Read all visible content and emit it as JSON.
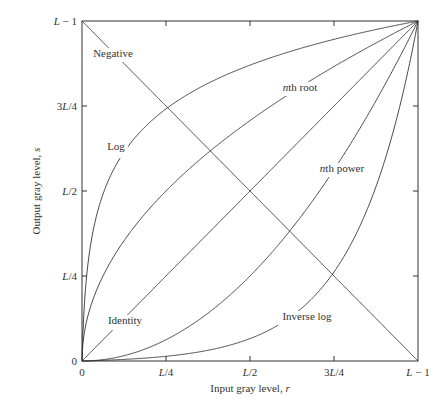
{
  "chart_data": {
    "type": "line",
    "title": "",
    "xlabel": "Input gray level, r",
    "ylabel": "Output gray level, s",
    "x_italic_var": "r",
    "y_italic_var": "s",
    "xlim": [
      0,
      1
    ],
    "ylim": [
      0,
      1
    ],
    "x_ticks": [
      {
        "value": 0,
        "label": "0"
      },
      {
        "value": 0.25,
        "label": "L/4"
      },
      {
        "value": 0.5,
        "label": "L/2"
      },
      {
        "value": 0.75,
        "label": "3L/4"
      },
      {
        "value": 1,
        "label": "L − 1"
      }
    ],
    "y_ticks": [
      {
        "value": 0,
        "label": "0"
      },
      {
        "value": 0.25,
        "label": "L/4"
      },
      {
        "value": 0.5,
        "label": "L/2"
      },
      {
        "value": 0.75,
        "label": "3L/4"
      },
      {
        "value": 1,
        "label": "L − 1"
      }
    ],
    "grid": false,
    "legend": "inline labels on curves",
    "series": [
      {
        "name": "Negative",
        "kind": "negative",
        "formula": "s = (L-1) - r",
        "x": [
          0,
          0.25,
          0.5,
          0.75,
          1
        ],
        "values": [
          1,
          0.75,
          0.5,
          0.25,
          0
        ]
      },
      {
        "name": "Log",
        "kind": "log",
        "formula": "s = c·log(1 + r)",
        "c": 200,
        "x": [
          0,
          0.05,
          0.1,
          0.25,
          0.5,
          0.75,
          1
        ],
        "values": [
          0,
          0.45,
          0.58,
          0.74,
          0.87,
          0.95,
          1
        ]
      },
      {
        "name": "nth root",
        "kind": "root",
        "formula": "s = r^(1/n)",
        "n": 2,
        "x": [
          0,
          0.1,
          0.25,
          0.5,
          0.75,
          1
        ],
        "values": [
          0,
          0.32,
          0.5,
          0.71,
          0.87,
          1
        ]
      },
      {
        "name": "Identity",
        "kind": "identity",
        "formula": "s = r",
        "x": [
          0,
          0.25,
          0.5,
          0.75,
          1
        ],
        "values": [
          0,
          0.25,
          0.5,
          0.75,
          1
        ]
      },
      {
        "name": "nth power",
        "kind": "power",
        "formula": "s = r^n",
        "n": 2,
        "x": [
          0,
          0.25,
          0.5,
          0.75,
          0.9,
          1
        ],
        "values": [
          0,
          0.06,
          0.25,
          0.56,
          0.81,
          1
        ]
      },
      {
        "name": "Inverse log",
        "kind": "invlog",
        "formula": "inverse of log",
        "c": 200,
        "x": [
          0,
          0.25,
          0.5,
          0.75,
          0.9,
          0.95,
          1
        ],
        "values": [
          0,
          0.05,
          0.13,
          0.26,
          0.42,
          0.55,
          1
        ]
      }
    ],
    "annotations": [
      {
        "text": "Negative",
        "x": 113,
        "y": 57,
        "italic_prefix": ""
      },
      {
        "text": "Log",
        "x": 116,
        "y": 150,
        "italic_prefix": ""
      },
      {
        "text": "th root",
        "x": 300,
        "y": 91,
        "italic_prefix": "n"
      },
      {
        "text": "th power",
        "x": 342,
        "y": 172,
        "italic_prefix": "n"
      },
      {
        "text": "Identity",
        "x": 125,
        "y": 324,
        "italic_prefix": ""
      },
      {
        "text": "Inverse log",
        "x": 307,
        "y": 320,
        "italic_prefix": ""
      }
    ]
  },
  "colors": {
    "line": "#333333",
    "background": "#ffffff"
  }
}
